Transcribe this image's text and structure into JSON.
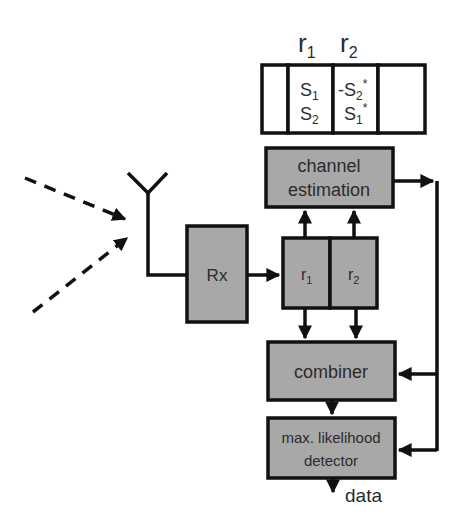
{
  "diagram": {
    "type": "block-diagram",
    "title": "",
    "frame": {
      "header_labels": [
        {
          "main": "r",
          "sub": "1"
        },
        {
          "main": "r",
          "sub": "2"
        }
      ],
      "cells": [
        {
          "line1": "",
          "line2": ""
        },
        {
          "line1": {
            "main": "S",
            "sub": "1",
            "sup": ""
          },
          "line2": {
            "main": "S",
            "sub": "2",
            "sup": ""
          }
        },
        {
          "line1": {
            "main": "-S",
            "sub": "2",
            "sup": "*"
          },
          "line2": {
            "main": "S",
            "sub": "1",
            "sup": "*"
          }
        },
        {
          "line1": "",
          "line2": ""
        }
      ]
    },
    "blocks": {
      "rx": {
        "label": "Rx"
      },
      "channel_estimation": {
        "line1": "channel",
        "line2": "estimation"
      },
      "buffer": {
        "r1": {
          "main": "r",
          "sub": "1"
        },
        "r2": {
          "main": "r",
          "sub": "2"
        }
      },
      "combiner": {
        "label": "combiner"
      },
      "detector": {
        "line1": "max. likelihood",
        "line2": "detector"
      }
    },
    "output_label": "data",
    "incoming_signals": 2,
    "colors": {
      "block_fill": "#a8a8a8",
      "stroke": "#111111",
      "cell_fill": "#ffffff",
      "text": "#2b2b2b"
    }
  }
}
